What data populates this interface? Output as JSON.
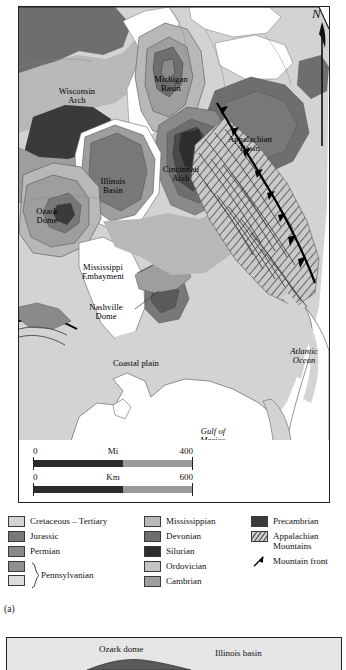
{
  "figure": {
    "panel_a_caption": "(a)",
    "north_letter": "N"
  },
  "map": {
    "labels": [
      {
        "name": "wisconsin-arch",
        "text": "Wisconsin\nArch",
        "x": 54,
        "y": 84,
        "italic": false
      },
      {
        "name": "michigan-basin",
        "text": "Michigan\nBasin",
        "x": 148,
        "y": 72,
        "italic": false
      },
      {
        "name": "appalachian-basin",
        "text": "Appalachian\nBasin",
        "x": 228,
        "y": 133,
        "italic": false
      },
      {
        "name": "illinois-basin",
        "text": "Illinois\nBasin",
        "x": 92,
        "y": 175,
        "italic": false
      },
      {
        "name": "cincinnati-arch",
        "text": "Cincinnati\nArch",
        "x": 158,
        "y": 164,
        "italic": false
      },
      {
        "name": "ozark-dome",
        "text": "Ozark\nDome",
        "x": 18,
        "y": 205,
        "italic": false
      },
      {
        "name": "mississippi-embayment",
        "text": "Mississippi\nEmbayment",
        "x": 74,
        "y": 262,
        "italic": false
      },
      {
        "name": "nashville-dome",
        "text": "Nashville\nDome",
        "x": 80,
        "y": 300,
        "italic": false
      },
      {
        "name": "coastal-plain",
        "text": "Coastal plain",
        "x": 112,
        "y": 357,
        "italic": false
      },
      {
        "name": "atlantic-ocean",
        "text": "Atlantic\nOcean",
        "x": 290,
        "y": 346,
        "italic": true
      },
      {
        "name": "gulf-of-mexico",
        "text": "Gulf of\nMexico",
        "x": 196,
        "y": 428,
        "italic": true
      }
    ]
  },
  "scale": {
    "miles": {
      "min": "0",
      "unit": "Mi",
      "max": "400"
    },
    "kilometers": {
      "min": "0",
      "unit": "Km",
      "max": "600"
    }
  },
  "legend": {
    "column1": [
      {
        "label": "Cretaceous – Tertiary",
        "color": "#d3d3d3"
      },
      {
        "label": "Jurassic",
        "color": "#787878"
      },
      {
        "label": "Permian",
        "color": "#8a8a8a"
      }
    ],
    "bracket_group": {
      "label": "Pennsylvanian",
      "colors": [
        "#8f8f8f",
        "#dcdcdc"
      ]
    },
    "column2": [
      {
        "label": "Mississippian",
        "color": "#b8b8b8"
      },
      {
        "label": "Devonian",
        "color": "#6e6e6e"
      },
      {
        "label": "Silurian",
        "color": "#2e2e2e"
      },
      {
        "label": "Ordovician",
        "color": "#c4c4c4"
      },
      {
        "label": "Cambrian",
        "color": "#9e9e9e"
      }
    ],
    "column3": [
      {
        "label": "Precambrian",
        "color": "#3a3a3a",
        "style": "solid"
      },
      {
        "label": "Appalachian Mountains",
        "color": "#cfcfcf",
        "style": "hatched"
      },
      {
        "label": "Mountain front",
        "color": "#000000",
        "style": "line-symbol"
      }
    ]
  },
  "panel_b": {
    "labels": [
      {
        "name": "ozark-dome-xs",
        "text": "Ozark dome",
        "x": 98,
        "y": 9
      },
      {
        "name": "illinois-basin-xs",
        "text": "Illinois basin",
        "x": 212,
        "y": 12
      }
    ]
  }
}
